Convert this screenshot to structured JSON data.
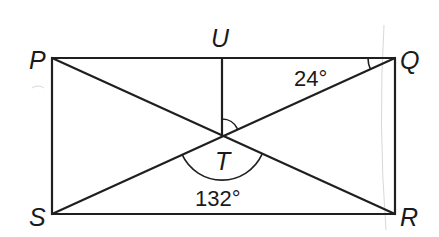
{
  "diagram": {
    "type": "geometry-rectangle-with-diagonals",
    "points": {
      "P": {
        "label": "P",
        "x": 52,
        "y": 58
      },
      "Q": {
        "label": "Q",
        "x": 395,
        "y": 58
      },
      "R": {
        "label": "R",
        "x": 395,
        "y": 214
      },
      "S": {
        "label": "S",
        "x": 52,
        "y": 214
      },
      "U": {
        "label": "U",
        "x": 222,
        "y": 58
      },
      "T": {
        "label": "T",
        "x": 222,
        "y": 136
      }
    },
    "segments": [
      "PQ",
      "QR",
      "RS",
      "SP",
      "PR",
      "QS",
      "UT"
    ],
    "angles": {
      "PQS": {
        "label": "24°",
        "vertex": "Q"
      },
      "STR": {
        "label": "132°",
        "vertex": "T"
      },
      "UTQ": {
        "label": "",
        "vertex": "T",
        "marked": true
      }
    },
    "labels": {
      "P": "P",
      "Q": "Q",
      "R": "R",
      "S": "S",
      "U": "U",
      "T": "T",
      "angle_Q": "24°",
      "angle_T": "132°"
    },
    "colors": {
      "line": "#1f1f1f",
      "background": "#ffffff"
    }
  }
}
